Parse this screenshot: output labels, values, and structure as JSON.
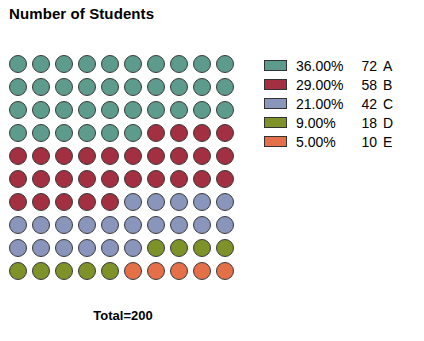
{
  "chart_data": {
    "type": "waffle",
    "title": "Number of Students",
    "xlabel": "",
    "ylabel": "",
    "total_label": "Total=200",
    "total": 200,
    "grid_rows": 10,
    "grid_columns": 10,
    "cells_total": 100,
    "units_per_cell": 2,
    "marker_shape": "circle",
    "fill_order": "row-major-left-to-right",
    "legend_position": "right",
    "grid": false,
    "categories": [
      "A",
      "B",
      "C",
      "D",
      "E"
    ],
    "values": [
      72,
      58,
      42,
      18,
      10
    ],
    "percents": [
      36.0,
      29.0,
      21.0,
      9.0,
      5.0
    ],
    "cell_counts": [
      36,
      29,
      21,
      9,
      5
    ],
    "colors": [
      "#5d9c8c",
      "#a33040",
      "#8a95bc",
      "#7d9329",
      "#e4704a"
    ],
    "series": [
      {
        "name": "A",
        "percent_label": "36.00%",
        "count_label": "72",
        "value": 72,
        "percent": 36.0,
        "cells": 36,
        "color": "#5d9c8c"
      },
      {
        "name": "B",
        "percent_label": "29.00%",
        "count_label": "58",
        "value": 58,
        "percent": 29.0,
        "cells": 29,
        "color": "#a33040"
      },
      {
        "name": "C",
        "percent_label": "21.00%",
        "count_label": "42",
        "value": 42,
        "percent": 21.0,
        "cells": 21,
        "color": "#8a95bc"
      },
      {
        "name": "D",
        "percent_label": "9.00%",
        "count_label": "18",
        "value": 18,
        "percent": 9.0,
        "cells": 9,
        "color": "#7d9329"
      },
      {
        "name": "E",
        "percent_label": "5.00%",
        "count_label": "10",
        "value": 10,
        "percent": 5.0,
        "cells": 5,
        "color": "#e4704a"
      }
    ]
  },
  "style": {
    "background": "#ffffff",
    "text_color": "#000000",
    "marker_border": "#3a3a3a",
    "legend_swatch_border": "#333333"
  }
}
